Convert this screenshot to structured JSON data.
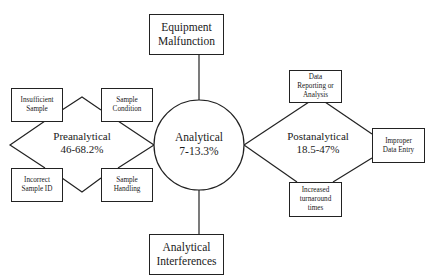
{
  "diagram": {
    "center": {
      "title": "Analytical",
      "range": "7-13.3%"
    },
    "top_box": {
      "label": "Equipment\nMalfunction"
    },
    "bottom_box": {
      "label": "Analytical\nInterferences"
    },
    "preanalytical": {
      "title": "Preanalytical",
      "range": "46-68.2%",
      "boxes": [
        {
          "label": "Insufficient\nSample"
        },
        {
          "label": "Sample\nCondition"
        },
        {
          "label": "Incorrect\nSample ID"
        },
        {
          "label": "Sample\nHandling"
        }
      ]
    },
    "postanalytical": {
      "title": "Postanalytical",
      "range": "18.5-47%",
      "boxes": [
        {
          "label": "Data\nReporting or\nAnalysis"
        },
        {
          "label": "Improper\nData Entry"
        },
        {
          "label": "Increased\nturnaround\ntimes"
        }
      ]
    },
    "colors": {
      "line": "#222222",
      "background": "#ffffff",
      "text": "#1a1a1a"
    }
  }
}
